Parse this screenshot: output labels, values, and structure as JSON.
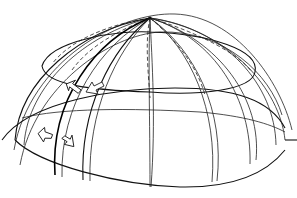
{
  "diagram": {
    "labels": [],
    "components": [
      {
        "name": "outer-hemisphere-envelope",
        "style": "thin solid"
      },
      {
        "name": "inner-dome-ellipse",
        "style": "solid"
      },
      {
        "name": "base-rim",
        "style": "solid"
      },
      {
        "name": "apex-hub",
        "style": "converging point"
      },
      {
        "name": "meridian-ribs",
        "style": "double solid lines",
        "count": 8
      },
      {
        "name": "rear-meridians",
        "style": "dashed",
        "count": 5
      },
      {
        "name": "flow-arrows",
        "count": 4,
        "directions": [
          "down-left",
          "up-left",
          "up-left",
          "down-right"
        ]
      },
      {
        "name": "anchor-stub",
        "position": "right side at base"
      }
    ],
    "colors": {
      "line": "#222222",
      "background": "#ffffff"
    }
  }
}
